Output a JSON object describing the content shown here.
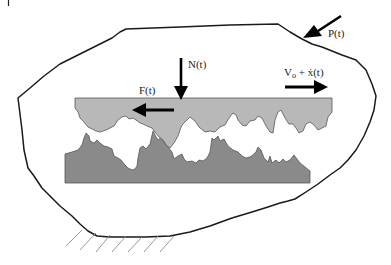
{
  "diagram": {
    "type": "free-body / rough surface contact schematic",
    "colors": {
      "outline": "#1a1a1a",
      "upper_surface_fill": "#b8b8b8",
      "lower_surface_fill": "#8a8a8a",
      "surface_edge": "#555555",
      "arrow": "#000000",
      "hatch": "#8c8c8c",
      "background": "#ffffff"
    },
    "labels": {
      "normal_force": "N(t)",
      "friction_force": "F(t)",
      "velocity_main": "V",
      "velocity_sub": "o",
      "velocity_rest": " + ẋ(t)",
      "applied_force": "P(t)"
    },
    "elements": [
      {
        "name": "body-outline",
        "description": "irregular closed outline of the body"
      },
      {
        "name": "upper-rough-surface",
        "description": "light gray slider with rough lower edge"
      },
      {
        "name": "lower-rough-surface",
        "description": "dark gray base with rough upper edge"
      },
      {
        "name": "ground-hatching",
        "description": "diagonal hatch marks indicating fixed support"
      }
    ]
  }
}
